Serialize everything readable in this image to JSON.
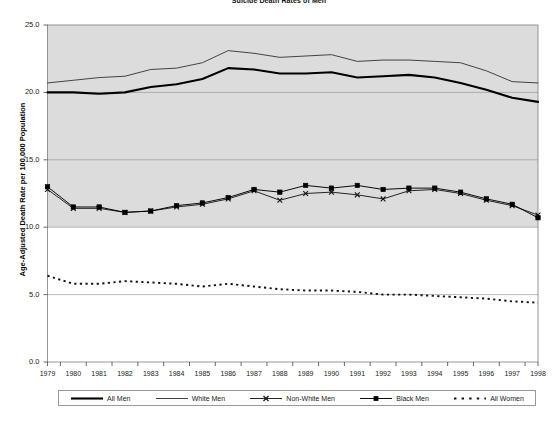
{
  "chart_data": {
    "type": "line",
    "title": "Suicide Death Rates of Men",
    "xlabel": "",
    "ylabel": "Age-Adjusted Death Rate per 100,000 Population",
    "xlim": [
      1979,
      1998
    ],
    "ylim": [
      0.0,
      25.0
    ],
    "ytick_labels": [
      "0.0",
      "5.0",
      "10.0",
      "15.0",
      "20.0",
      "25.0"
    ],
    "ytick_values": [
      0.0,
      5.0,
      10.0,
      15.0,
      20.0,
      25.0
    ],
    "grid": true,
    "legend_position": "bottom",
    "categories": [
      1979,
      1980,
      1981,
      1982,
      1983,
      1984,
      1985,
      1986,
      1987,
      1988,
      1989,
      1990,
      1991,
      1992,
      1993,
      1994,
      1995,
      1996,
      1997,
      1998
    ],
    "x_tick_labels": [
      "1979",
      "1980",
      "1981",
      "1982",
      "1983",
      "1984",
      "1985",
      "1986",
      "1987",
      "1988",
      "1989",
      "1990",
      "1991",
      "1992",
      "1993",
      "1994",
      "1995",
      "1996",
      "1997",
      "1998"
    ],
    "series": [
      {
        "name": "All Men",
        "style": "solid-thick",
        "color": "#000000",
        "marker": "none",
        "values": [
          20.0,
          20.0,
          19.9,
          20.0,
          20.4,
          20.6,
          21.0,
          21.8,
          21.7,
          21.4,
          21.4,
          21.5,
          21.1,
          21.2,
          21.3,
          21.1,
          20.7,
          20.2,
          19.6,
          19.3
        ]
      },
      {
        "name": "White Men",
        "style": "solid-thin",
        "color": "#3a3a3a",
        "marker": "none",
        "values": [
          20.7,
          20.9,
          21.1,
          21.2,
          21.7,
          21.8,
          22.2,
          23.1,
          22.9,
          22.6,
          22.7,
          22.8,
          22.3,
          22.4,
          22.4,
          22.3,
          22.2,
          21.6,
          20.8,
          20.7
        ]
      },
      {
        "name": "Non-White Men",
        "style": "solid-thin-marker",
        "color": "#1a1a1a",
        "marker": "x",
        "values": [
          12.8,
          11.4,
          11.4,
          11.1,
          11.2,
          11.5,
          11.7,
          12.1,
          12.7,
          12.0,
          12.5,
          12.6,
          12.4,
          12.1,
          12.7,
          12.8,
          12.5,
          12.0,
          11.6,
          10.9
        ]
      },
      {
        "name": "Black Men",
        "style": "solid-thin-marker",
        "color": "#000000",
        "marker": "square",
        "values": [
          13.0,
          11.5,
          11.5,
          11.1,
          11.2,
          11.6,
          11.8,
          12.2,
          12.8,
          12.6,
          13.1,
          12.9,
          13.1,
          12.8,
          12.9,
          12.9,
          12.6,
          12.1,
          11.7,
          10.7
        ]
      },
      {
        "name": "All Women",
        "style": "dotted",
        "color": "#111111",
        "marker": "none",
        "values": [
          6.4,
          5.8,
          5.8,
          6.0,
          5.9,
          5.8,
          5.6,
          5.8,
          5.6,
          5.4,
          5.3,
          5.3,
          5.2,
          5.0,
          5.0,
          4.9,
          4.8,
          4.7,
          4.5,
          4.4
        ]
      }
    ]
  },
  "legend": {
    "items": [
      {
        "label": "All Men",
        "swatch": "solid-thick-swatch"
      },
      {
        "label": "White Men",
        "swatch": "solid-thin-swatch"
      },
      {
        "label": "Non-White Men",
        "swatch": "x-marker-swatch"
      },
      {
        "label": "Black Men",
        "swatch": "square-marker-swatch"
      },
      {
        "label": "All Women",
        "swatch": "dotted-swatch"
      }
    ]
  },
  "colors": {
    "plot_band_fill": "#dcdcdc",
    "plot_background": "#ffffff",
    "gridline": "#9a9a9a",
    "axis": "#555555",
    "text": "#1a1a1a"
  }
}
